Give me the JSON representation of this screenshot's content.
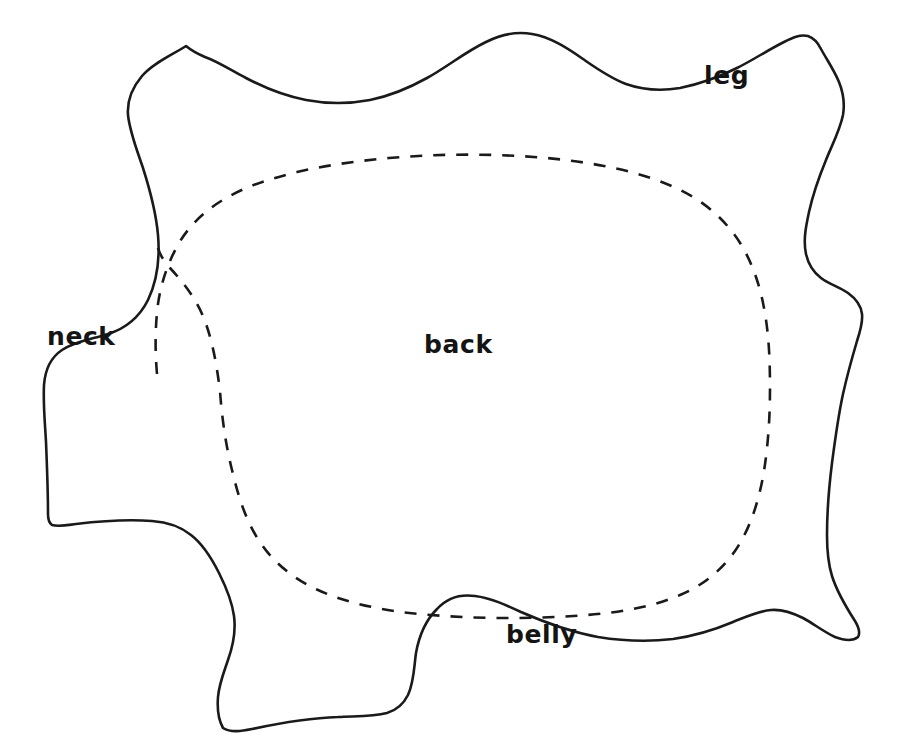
{
  "figure": {
    "kind": "hand-drawn-hide-pattern-diagram",
    "background_color": "#ffffff",
    "stroke_color": "#1a1a1a",
    "label_color": "#141414",
    "outline_style": "solid",
    "inner_contour_style": "dashed"
  },
  "labels": {
    "neck": "neck",
    "back": "back",
    "leg": "leg",
    "belly": "belly"
  },
  "label_positions": {
    "neck": {
      "x": 47,
      "y": 345
    },
    "back": {
      "x": 424,
      "y": 353
    },
    "leg": {
      "x": 704,
      "y": 84
    },
    "belly": {
      "x": 506,
      "y": 643
    }
  },
  "geometry": {
    "outline_d": "M 186 46 C 172 55 153 63 142 76 C 131 89 127 102 128 115 C 130 133 137 150 143 168 C 150 190 156 212 158 235 C 160 258 157 281 148 300 C 139 318 124 329 108 334 C 93 339 76 341 62 350 C 50 358 45 371 44 385 C 43 404 45 423 46 442 C 47 466 48 490 48 514 C 48 519 49 523 52 525 C 59 527 68 525 76 524 C 101 521 127 519 152 521 C 166 522 180 526 191 535 C 204 545 212 559 219 573 C 226 587 232 601 234 616 C 236 631 233 646 228 660 C 224 672 219 684 218 697 C 217 710 219 721 223 728 C 231 733 242 731 252 729 C 280 723 309 718 338 717 C 355 716 372 717 387 713 C 397 710 404 703 408 695 C 414 682 414 667 416 653 C 419 636 426 620 437 609 C 447 598 461 594 475 596 C 491 598 506 605 521 612 C 546 623 571 632 598 637 C 623 641 648 642 673 639 C 694 636 714 630 733 622 C 746 617 758 611 771 610 C 782 609 793 613 803 618 C 814 624 824 632 835 637 C 843 640 852 642 858 637 C 861 632 858 626 855 621 C 846 607 837 592 832 576 C 828 563 827 549 827 535 C 827 511 829 487 832 463 C 835 440 838 417 843 394 C 847 376 852 358 857 341 C 860 332 863 323 862 314 C 861 305 855 298 848 293 C 839 287 829 284 821 278 C 813 272 808 263 806 254 C 803 240 806 226 809 212 C 813 194 819 177 826 160 C 832 145 840 130 843 115 C 845 103 843 92 839 82 C 834 70 827 60 821 49 C 818 43 814 38 808 36 C 800 34 792 38 784 42 C 768 50 753 60 737 68 C 719 77 700 84 680 88 C 662 91 643 90 626 84 C 610 78 596 68 583 59 C 566 47 550 37 532 34 C 516 31 500 35 486 42 C 465 52 447 67 427 78 C 409 88 390 96 370 100 C 349 104 327 104 306 100 C 285 96 265 88 246 78 C 232 71 219 62 205 57 C 198 54 192 51 186 46 Z",
    "seam_d": "M 157 374 C 155 351 155 327 158 304 C 161 283 168 262 179 243 C 191 223 208 208 228 197 C 249 185 273 178 297 172 C 327 165 358 161 389 158 C 424 155 459 154 494 155 C 531 156 568 159 604 166 C 635 172 666 181 693 197 C 713 209 730 226 742 246 C 753 265 760 286 764 308 C 769 334 770 361 770 388 C 770 418 768 448 763 477 C 758 503 750 529 735 551 C 721 571 702 586 680 595 C 657 605 632 610 607 613 C 573 617 539 618 505 618 C 470 618 435 616 401 612 C 373 608 344 602 318 590 C 296 580 276 565 262 545 C 247 524 239 499 233 474 C 226 447 222 419 220 391 C 217 367 213 343 205 321 C 197 300 184 283 170 268 C 163 260 158 252 157 243"
  }
}
